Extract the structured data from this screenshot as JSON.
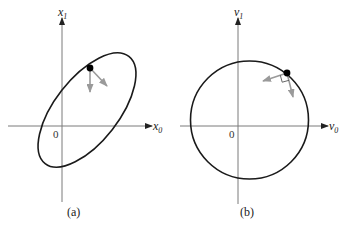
{
  "figure": {
    "panels": [
      {
        "id": "a",
        "caption": "(a)",
        "x_axis": {
          "var": "x",
          "sub": "0"
        },
        "y_axis": {
          "var": "x",
          "sub": "1"
        },
        "origin_label": "0",
        "curve": "tilted ellipse",
        "point": "filled dot on ellipse",
        "vectors": [
          "downward gray arrow",
          "diagonal gray arrow (down-right)"
        ]
      },
      {
        "id": "b",
        "caption": "(b)",
        "x_axis": {
          "var": "v",
          "sub": "0"
        },
        "y_axis": {
          "var": "v",
          "sub": "1"
        },
        "origin_label": "0",
        "curve": "circle",
        "point": "filled dot on circle",
        "vectors": [
          "leftward gray arrow",
          "downward gray arrow"
        ],
        "right_angle_marker": true
      }
    ],
    "colors": {
      "curve": "#1a1a1a",
      "axis": "#7a7a7a",
      "vector": "#9a9a9a"
    }
  }
}
